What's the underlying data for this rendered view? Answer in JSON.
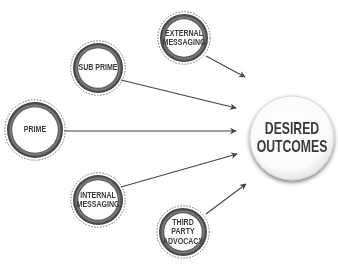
{
  "diagram": {
    "type": "hub-and-spoke",
    "target": {
      "id": "desired-outcomes",
      "label_line1": "DESIRED",
      "label_line2": "OUTCOMES",
      "cx": 292,
      "cy": 138,
      "r": 42
    },
    "sources": [
      {
        "id": "external-messaging",
        "label_line1": "EXTERNAL",
        "label_line2": "MESSAGING",
        "cx": 184,
        "cy": 38,
        "r": 24
      },
      {
        "id": "sub-prime",
        "label_line1": "SUB PRIME",
        "label_line2": "",
        "cx": 98,
        "cy": 68,
        "r": 25
      },
      {
        "id": "prime",
        "label_line1": "PRIME",
        "label_line2": "",
        "cx": 35,
        "cy": 130,
        "r": 28
      },
      {
        "id": "internal-messaging",
        "label_line1": "INTERNAL",
        "label_line2": "MESSAGING",
        "cx": 98,
        "cy": 200,
        "r": 25
      },
      {
        "id": "third-party-advocacy",
        "label_line1": "THIRD PARTY",
        "label_line2": "ADVOCACY",
        "cx": 183,
        "cy": 232,
        "r": 24
      }
    ],
    "edges": [
      {
        "from": "external-messaging",
        "to": "desired-outcomes",
        "x1": 206,
        "y1": 56,
        "x2": 245,
        "y2": 77
      },
      {
        "from": "sub-prime",
        "to": "desired-outcomes",
        "x1": 121,
        "y1": 80,
        "x2": 236,
        "y2": 108
      },
      {
        "from": "prime",
        "to": "desired-outcomes",
        "x1": 64,
        "y1": 131,
        "x2": 236,
        "y2": 131
      },
      {
        "from": "internal-messaging",
        "to": "desired-outcomes",
        "x1": 121,
        "y1": 187,
        "x2": 237,
        "y2": 154
      },
      {
        "from": "third-party-advocacy",
        "to": "desired-outcomes",
        "x1": 206,
        "y1": 214,
        "x2": 246,
        "y2": 184
      }
    ],
    "colors": {
      "ring_dark": "#3b3b3b",
      "ring_mid": "#7a7a7a",
      "dashed_outline": "#555555",
      "arrow": "#444444",
      "text": "#3a3a3a",
      "target_fill": "#ffffff",
      "target_shadow": "#b5b5b5"
    }
  }
}
